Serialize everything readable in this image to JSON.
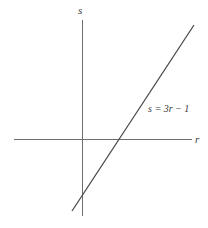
{
  "diagram": {
    "type": "coordinate-plane-line",
    "axes": {
      "horizontal_label": "r",
      "vertical_label": "s"
    },
    "line": {
      "equation_label": "s = 3r − 1",
      "slope": 3,
      "intercept": -1
    },
    "colors": {
      "axis": "#6e6e6e",
      "line": "#4a4a4a",
      "text": "#3a3a3a",
      "background": "#ffffff"
    }
  }
}
